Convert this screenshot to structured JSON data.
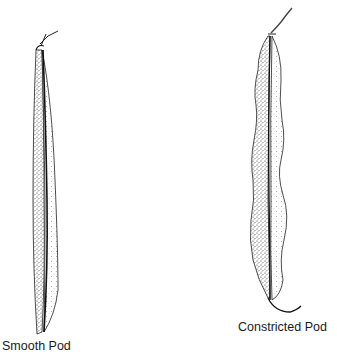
{
  "figure": {
    "pods": [
      {
        "id": "smooth",
        "label": "Smooth Pod"
      },
      {
        "id": "constricted",
        "label": "Constricted Pod"
      }
    ],
    "colors": {
      "ink": "#1a1a1a",
      "background": "#ffffff"
    }
  }
}
